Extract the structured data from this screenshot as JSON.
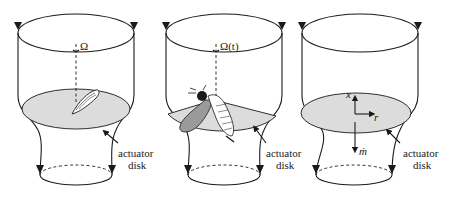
{
  "panels": [
    {
      "id": "panel-rotor",
      "rotation_label": "Ω",
      "disk_label_line1": "actuator",
      "disk_label_line2": "disk",
      "object": "rotor-blade"
    },
    {
      "id": "panel-insect",
      "rotation_label": "Ω(t)",
      "disk_label_line1": "actuator",
      "disk_label_line2": "disk",
      "object": "flapping-insect"
    },
    {
      "id": "panel-axes",
      "axis_x_label": "x",
      "axis_r_label": "r",
      "mass_flow_label": "ṁ",
      "disk_label_line1": "actuator",
      "disk_label_line2": "disk",
      "object": "coordinate-axes"
    }
  ],
  "colors": {
    "line": "#1a1a1a",
    "disk_fill": "#dcdcdc",
    "wing_fill": "#9a9a9a"
  }
}
